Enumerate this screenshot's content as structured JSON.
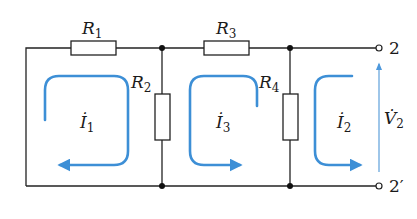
{
  "diagram": {
    "type": "ladder circuit with mesh currents",
    "colors": {
      "wire": "#222222",
      "loop": "#3d8fd6",
      "voltage_arrow": "#6aa8de"
    },
    "resistors": [
      {
        "id": "R1",
        "symbol": "R",
        "subscript": "1",
        "orientation": "horizontal"
      },
      {
        "id": "R2",
        "symbol": "R",
        "subscript": "2",
        "orientation": "vertical"
      },
      {
        "id": "R3",
        "symbol": "R",
        "subscript": "3",
        "orientation": "horizontal"
      },
      {
        "id": "R4",
        "symbol": "R",
        "subscript": "4",
        "orientation": "vertical"
      }
    ],
    "mesh_currents": [
      {
        "id": "I1",
        "symbol": "İ",
        "subscript": "1",
        "direction": "clockwise"
      },
      {
        "id": "I3",
        "symbol": "İ",
        "subscript": "3",
        "direction": "counterclockwise"
      },
      {
        "id": "I2",
        "symbol": "İ",
        "subscript": "2",
        "direction": "counterclockwise"
      }
    ],
    "voltage": {
      "symbol": "V̇",
      "subscript": "2",
      "direction": "up"
    },
    "terminals": [
      {
        "id": "2",
        "label": "2",
        "position": "top"
      },
      {
        "id": "2prime",
        "label": "2′",
        "position": "bottom"
      }
    ]
  }
}
